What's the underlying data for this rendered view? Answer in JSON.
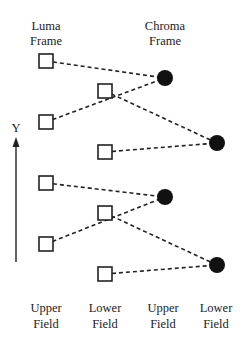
{
  "diagram": {
    "headers": {
      "luma_line1": "Luma",
      "luma_line2": "Frame",
      "chroma_line1": "Chroma",
      "chroma_line2": "Frame"
    },
    "axis": {
      "label": "Y"
    },
    "footers": [
      {
        "line1": "Upper",
        "line2": "Field"
      },
      {
        "line1": "Lower",
        "line2": "Field"
      },
      {
        "line1": "Upper",
        "line2": "Field"
      },
      {
        "line1": "Lower",
        "line2": "Field"
      }
    ],
    "luma_samples": [
      {
        "field": "upper",
        "x": 46,
        "y": 61
      },
      {
        "field": "lower",
        "x": 105,
        "y": 91
      },
      {
        "field": "upper",
        "x": 46,
        "y": 122
      },
      {
        "field": "lower",
        "x": 105,
        "y": 152
      },
      {
        "field": "upper",
        "x": 46,
        "y": 183
      },
      {
        "field": "lower",
        "x": 105,
        "y": 213
      },
      {
        "field": "upper",
        "x": 46,
        "y": 244
      },
      {
        "field": "lower",
        "x": 105,
        "y": 274
      }
    ],
    "chroma_samples": [
      {
        "field": "upper",
        "x": 165,
        "y": 78
      },
      {
        "field": "lower",
        "x": 217,
        "y": 143
      },
      {
        "field": "upper",
        "x": 165,
        "y": 197
      },
      {
        "field": "lower",
        "x": 217,
        "y": 265
      }
    ],
    "colors": {
      "ink": "#222222",
      "background": "#ffffff"
    }
  }
}
